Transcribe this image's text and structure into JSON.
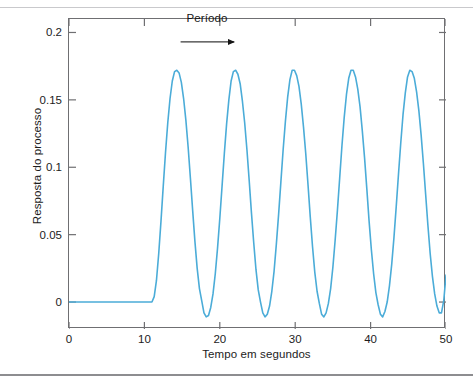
{
  "chart_data": {
    "type": "line",
    "title": "",
    "subtitle": "",
    "xlabel": "Tempo em segundos",
    "ylabel": "Resposta do processo",
    "xlim": [
      0,
      50
    ],
    "ylim": [
      -0.02,
      0.21
    ],
    "xticks": [
      0,
      10,
      20,
      30,
      40,
      50
    ],
    "xticklabels": [
      "0",
      "10",
      "20",
      "30",
      "40",
      "50"
    ],
    "yticks": [
      0,
      0.05,
      0.1,
      0.15,
      0.2
    ],
    "yticklabels": [
      "0",
      "0.05",
      "0.1",
      "0.15",
      "0.2"
    ],
    "grid": false,
    "legend": null,
    "legend_position": "none",
    "line_color": "#4BACD8",
    "line_width": 1.6,
    "annotations": [
      {
        "name": "periodo-arrow",
        "text": "Período",
        "arrow_x_start": 14.8,
        "arrow_x_end": 21.9,
        "arrow_y": 0.193,
        "label_x": 18.3,
        "label_y": 0.206
      }
    ],
    "step_time": 11.0,
    "period": 7.1,
    "peak_value": 0.172,
    "trough_value": -0.011,
    "baseline_value": 0,
    "series": [
      {
        "name": "Resposta do processo",
        "color": "#4BACD8",
        "x": [
          0,
          1,
          2,
          3,
          4,
          5,
          6,
          7,
          8,
          9,
          10,
          11,
          11.3,
          11.6,
          11.9,
          12.2,
          12.5,
          12.8,
          13.1,
          13.4,
          13.7,
          14.0,
          14.3,
          14.6,
          14.9,
          15.2,
          15.5,
          15.8,
          16.1,
          16.4,
          16.7,
          17.0,
          17.3,
          17.6,
          17.9,
          18.2,
          18.5,
          18.8,
          19.1,
          19.4,
          19.7,
          20.0,
          20.3,
          20.6,
          20.9,
          21.2,
          21.5,
          21.8,
          22.1,
          22.4,
          22.7,
          23.0,
          23.3,
          23.6,
          23.9,
          24.2,
          24.5,
          24.8,
          25.1,
          25.4,
          25.7,
          26.0,
          26.3,
          26.6,
          26.9,
          27.2,
          27.5,
          27.8,
          28.1,
          28.4,
          28.7,
          29.0,
          29.3,
          29.6,
          29.9,
          30.2,
          30.5,
          30.8,
          31.1,
          31.4,
          31.7,
          32.0,
          32.3,
          32.6,
          32.9,
          33.2,
          33.5,
          33.8,
          34.1,
          34.4,
          34.7,
          35.0,
          35.3,
          35.6,
          35.9,
          36.2,
          36.5,
          36.8,
          37.1,
          37.4,
          37.7,
          38.0,
          38.3,
          38.6,
          38.9,
          39.2,
          39.5,
          39.8,
          40.1,
          40.4,
          40.7,
          41.0,
          41.3,
          41.6,
          41.9,
          42.2,
          42.5,
          42.8,
          43.1,
          43.4,
          43.7,
          44.0,
          44.3,
          44.6,
          44.9,
          45.2,
          45.5,
          45.8,
          46.1,
          46.4,
          46.7,
          47.0,
          47.3,
          47.6,
          47.9,
          48.2,
          48.5,
          48.8,
          49.1,
          49.4,
          49.7,
          50.0
        ],
        "y": [
          0,
          0,
          0,
          0,
          0,
          0,
          0,
          0,
          0,
          0,
          0,
          0,
          0.004,
          0.016,
          0.036,
          0.06,
          0.086,
          0.111,
          0.133,
          0.151,
          0.164,
          0.171,
          0.172,
          0.17,
          0.163,
          0.151,
          0.135,
          0.115,
          0.092,
          0.068,
          0.045,
          0.025,
          0.01,
          0.001,
          -0.008,
          -0.011,
          -0.01,
          -0.004,
          0.006,
          0.021,
          0.04,
          0.062,
          0.086,
          0.11,
          0.132,
          0.15,
          0.164,
          0.171,
          0.172,
          0.169,
          0.162,
          0.149,
          0.133,
          0.113,
          0.09,
          0.066,
          0.044,
          0.024,
          0.009,
          0.0,
          -0.008,
          -0.011,
          -0.009,
          -0.003,
          0.008,
          0.023,
          0.043,
          0.065,
          0.089,
          0.113,
          0.134,
          0.152,
          0.165,
          0.172,
          0.172,
          0.168,
          0.16,
          0.147,
          0.13,
          0.11,
          0.087,
          0.063,
          0.041,
          0.022,
          0.008,
          -0.001,
          -0.009,
          -0.011,
          -0.008,
          -0.001,
          0.01,
          0.026,
          0.046,
          0.068,
          0.092,
          0.116,
          0.137,
          0.154,
          0.166,
          0.172,
          0.172,
          0.167,
          0.158,
          0.145,
          0.127,
          0.107,
          0.084,
          0.06,
          0.039,
          0.021,
          0.007,
          -0.002,
          -0.009,
          -0.011,
          -0.007,
          0.0,
          0.012,
          0.028,
          0.048,
          0.071,
          0.095,
          0.118,
          0.139,
          0.155,
          0.167,
          0.172,
          0.171,
          0.166,
          0.156,
          0.142,
          0.124,
          0.103,
          0.08,
          0.057,
          0.036,
          0.019,
          0.006,
          -0.003,
          -0.008,
          -0.008,
          0.001,
          0.02
        ]
      }
    ]
  }
}
